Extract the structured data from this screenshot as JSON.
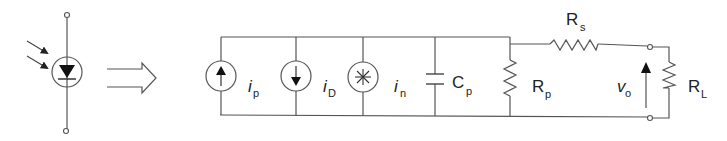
{
  "diagram": {
    "symbol": {
      "name": "photodiode",
      "light_arrows": 2
    },
    "transform_arrow": "equivalent-to",
    "components": [
      {
        "id": "ip",
        "type": "current-source",
        "direction": "up",
        "label": "i",
        "subscript": "p"
      },
      {
        "id": "iD",
        "type": "current-source",
        "direction": "down",
        "label": "i",
        "subscript": "D"
      },
      {
        "id": "in",
        "type": "noise-source",
        "label": "i",
        "subscript": "n"
      },
      {
        "id": "Cp",
        "type": "capacitor",
        "label": "C",
        "subscript": "p"
      },
      {
        "id": "Rp",
        "type": "resistor",
        "label": "R",
        "subscript": "p"
      },
      {
        "id": "Rs",
        "type": "resistor-series",
        "label": "R",
        "subscript": "s"
      },
      {
        "id": "vo",
        "type": "output-voltage",
        "label": "v",
        "subscript": "o"
      },
      {
        "id": "RL",
        "type": "resistor-load",
        "label": "R",
        "subscript": "L"
      }
    ],
    "stroke_color": "#555555"
  }
}
